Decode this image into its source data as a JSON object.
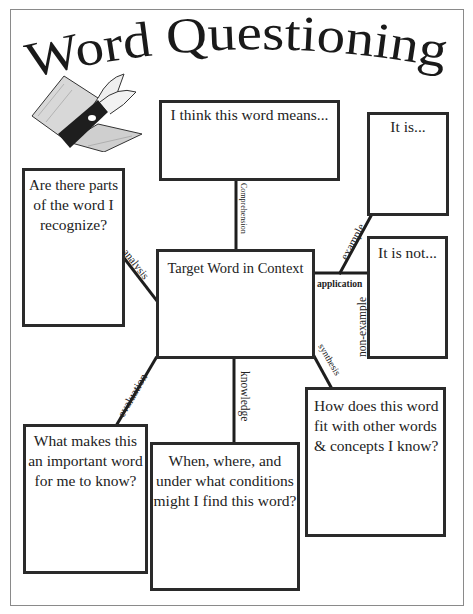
{
  "title": "Word Questioning",
  "illustration": "open-book-icon",
  "center": {
    "label": "Target Word in Context"
  },
  "boxes": {
    "meaning": "I think this word means...",
    "it_is": "It is...",
    "it_is_not": "It is not...",
    "parts": [
      "Are there parts",
      "of the word I",
      "recognize?"
    ],
    "important": [
      "What makes this",
      "an important word",
      "for me to know?"
    ],
    "conditions": [
      "When, where, and",
      "under what conditions",
      "might I find this word?"
    ],
    "fit": [
      "How does this word",
      "fit with other words",
      "& concepts I know?"
    ]
  },
  "connectors": {
    "comprehension": "Comprehension",
    "analysis": "analysis",
    "example": "example",
    "application": "application",
    "non_example": "non-example",
    "synthesis": "synthesis",
    "evaluation": "evaluation",
    "knowledge": "knowledge"
  }
}
